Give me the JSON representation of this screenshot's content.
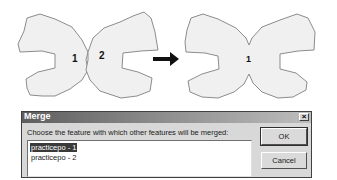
{
  "figure": {
    "before": {
      "features": [
        {
          "label": "1"
        },
        {
          "label": "2"
        }
      ]
    },
    "arrow_icon": "right-arrow",
    "after": {
      "features": [
        {
          "label": "1"
        }
      ]
    },
    "colors": {
      "polygon_fill": "#f0f0f0",
      "polygon_stroke": "#8c8c8c",
      "arrow": "#111111"
    }
  },
  "dialog": {
    "title": "Merge",
    "close_glyph": "×",
    "prompt": "Choose the feature with which other features will be merged:",
    "list": {
      "items": [
        {
          "label": "practicepo - 1",
          "selected": true
        },
        {
          "label": "practicepo - 2",
          "selected": false
        }
      ]
    },
    "buttons": {
      "ok": "OK",
      "cancel": "Cancel"
    }
  }
}
